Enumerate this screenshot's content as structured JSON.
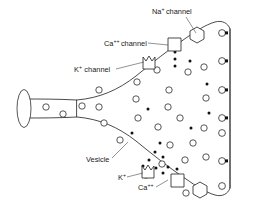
{
  "figure": {
    "background_color": "#ffffff",
    "stroke_color": "#2b2b2b",
    "ion_color": "#111111"
  },
  "labels": {
    "na_channel": {
      "base": "Na",
      "sup": "+",
      "rest": "channel",
      "x": 152,
      "y": 14
    },
    "ca_channel": {
      "base": "Ca",
      "sup": "++",
      "rest": "channel",
      "x": 104,
      "y": 46
    },
    "k_channel": {
      "base": "K",
      "sup": "+",
      "rest": "channel",
      "x": 74,
      "y": 72
    },
    "vesicle": {
      "base": "Vesicle",
      "sup": "",
      "rest": "",
      "x": 86,
      "y": 162
    },
    "k_ion": {
      "base": "K",
      "sup": "+",
      "rest": "",
      "x": 118,
      "y": 180
    },
    "ca_ion": {
      "base": "Ca",
      "sup": "++",
      "rest": "",
      "x": 138,
      "y": 190
    }
  },
  "leaders": [
    {
      "name": "na-channel-leader",
      "d": "M 186 17 L 196 33"
    },
    {
      "name": "ca-channel-leader",
      "d": "M 148 43 L 168 45"
    },
    {
      "name": "k-channel-leader",
      "d": "M 116 69 L 144 62"
    },
    {
      "name": "vesicle-leader",
      "d": "M 112 158 L 128 142"
    },
    {
      "name": "k-ion-leader",
      "d": "M 127 177 L 143 173"
    },
    {
      "name": "ca-ion-leader",
      "d": "M 156 187 L 168 180"
    }
  ],
  "shapes": {
    "membrane_path": "M 77 100 C 100 98 118 90 136 76 C 152 63 168 50 186 38 C 196 31 205 25 215 22 C 222 20 228 23 230 29 L 230 188 C 228 194 222 197 215 195 C 205 192 196 186 186 179 C 168 167 152 154 136 141 C 118 127 100 119 77 117 Z",
    "axon_top": "M 24 99 C 40 99 58 99 77 100",
    "axon_bottom": "M 24 118 C 40 118 58 118 77 117",
    "axon_cap": {
      "cx": 24,
      "cy": 108.5,
      "rx": 7,
      "ry": 19
    },
    "right_membrane_inner": "M 230 29 L 230 188"
  },
  "channels": [
    {
      "name": "ca-channel-upper",
      "type": "square",
      "x": 168,
      "y": 38,
      "size": 13
    },
    {
      "name": "k-channel-upper",
      "type": "notched-square",
      "x": 143,
      "y": 57,
      "size": 12
    },
    {
      "name": "na-channel-upper",
      "type": "hexagon",
      "cx": 197,
      "cy": 35,
      "r": 8
    },
    {
      "name": "k-channel-lower",
      "type": "notched-square",
      "x": 142,
      "y": 166,
      "size": 12
    },
    {
      "name": "ca-channel-lower",
      "type": "square",
      "x": 171,
      "y": 174,
      "size": 13
    },
    {
      "name": "na-channel-lower",
      "type": "hexagon",
      "cx": 200,
      "cy": 190,
      "r": 8
    }
  ],
  "vesicles": [
    {
      "cx": 46,
      "cy": 107,
      "r": 3.2
    },
    {
      "cx": 63,
      "cy": 114,
      "r": 3.2
    },
    {
      "cx": 82,
      "cy": 106,
      "r": 3.2
    },
    {
      "cx": 99,
      "cy": 107,
      "r": 3.2
    },
    {
      "cx": 104,
      "cy": 123,
      "r": 3.2
    },
    {
      "cx": 99,
      "cy": 90,
      "r": 3.2
    },
    {
      "cx": 120,
      "cy": 140,
      "r": 3.2
    },
    {
      "cx": 136,
      "cy": 99,
      "r": 3.2
    },
    {
      "cx": 138,
      "cy": 118,
      "r": 3.2
    },
    {
      "cx": 137,
      "cy": 82,
      "r": 3.2
    },
    {
      "cx": 157,
      "cy": 70,
      "r": 3.2
    },
    {
      "cx": 158,
      "cy": 127,
      "r": 3.2
    },
    {
      "cx": 168,
      "cy": 107,
      "r": 3.2
    },
    {
      "cx": 169,
      "cy": 90,
      "r": 3.2
    },
    {
      "cx": 170,
      "cy": 145,
      "r": 3.2
    },
    {
      "cx": 162,
      "cy": 164,
      "r": 3.2
    },
    {
      "cx": 185,
      "cy": 160,
      "r": 3.2
    },
    {
      "cx": 188,
      "cy": 72,
      "r": 3.2
    },
    {
      "cx": 204,
      "cy": 67,
      "r": 3.2
    },
    {
      "cx": 206,
      "cy": 98,
      "r": 3.2
    },
    {
      "cx": 204,
      "cy": 128,
      "r": 3.2
    },
    {
      "cx": 206,
      "cy": 157,
      "r": 3.2
    },
    {
      "cx": 186,
      "cy": 193,
      "r": 3.2
    },
    {
      "cx": 180,
      "cy": 118,
      "r": 3.2
    },
    {
      "cx": 193,
      "cy": 143,
      "r": 3.2
    },
    {
      "cx": 146,
      "cy": 175,
      "r": 3.2
    }
  ],
  "docked_vesicles": [
    {
      "cx": 222,
      "cy": 33,
      "r": 3.4
    },
    {
      "cx": 222,
      "cy": 61,
      "r": 3.4
    },
    {
      "cx": 222,
      "cy": 90,
      "r": 3.4
    },
    {
      "cx": 222,
      "cy": 118,
      "r": 3.4
    },
    {
      "cx": 222,
      "cy": 133,
      "r": 3.4
    },
    {
      "cx": 222,
      "cy": 161,
      "r": 3.4
    },
    {
      "cx": 222,
      "cy": 186,
      "r": 3.4
    }
  ],
  "ions": [
    {
      "cx": 175,
      "cy": 52,
      "r": 1.5
    },
    {
      "cx": 175,
      "cy": 59,
      "r": 1.5
    },
    {
      "cx": 175,
      "cy": 66,
      "r": 1.5
    },
    {
      "cx": 190,
      "cy": 61,
      "r": 1.5
    },
    {
      "cx": 148,
      "cy": 109,
      "r": 1.5
    },
    {
      "cx": 132,
      "cy": 133,
      "r": 1.5
    },
    {
      "cx": 209,
      "cy": 113,
      "r": 1.5
    },
    {
      "cx": 207,
      "cy": 84,
      "r": 1.5
    },
    {
      "cx": 160,
      "cy": 143,
      "r": 1.5
    },
    {
      "cx": 155,
      "cy": 152,
      "r": 1.5
    },
    {
      "cx": 149,
      "cy": 160,
      "r": 1.5
    },
    {
      "cx": 143,
      "cy": 166,
      "r": 1.5
    },
    {
      "cx": 163,
      "cy": 157,
      "r": 1.5
    },
    {
      "cx": 156,
      "cy": 168,
      "r": 1.5
    },
    {
      "cx": 168,
      "cy": 167,
      "r": 1.5
    },
    {
      "cx": 152,
      "cy": 176,
      "r": 1.5
    },
    {
      "cx": 163,
      "cy": 173,
      "r": 1.5
    },
    {
      "cx": 177,
      "cy": 169,
      "r": 1.5
    },
    {
      "cx": 191,
      "cy": 128,
      "r": 1.5
    }
  ]
}
